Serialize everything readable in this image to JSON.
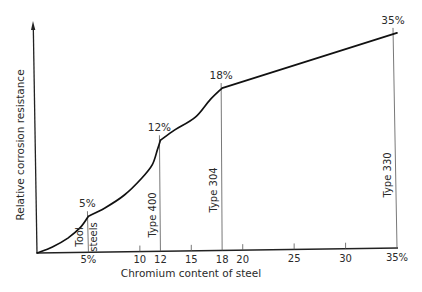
{
  "chart_data": {
    "type": "line",
    "title": "",
    "xlabel": "Chromium content of steel",
    "ylabel": "Relative corrosion resistance",
    "xlim": [
      0,
      35
    ],
    "ylim": [
      0,
      100
    ],
    "y_units": "relative (no numeric scale shown)",
    "grid": false,
    "legend": "none",
    "x_ticks": [
      5,
      10,
      12,
      15,
      18,
      20,
      25,
      30,
      35
    ],
    "x_tick_labels": [
      "5%",
      "10",
      "12",
      "15",
      "18",
      "20",
      "25",
      "30",
      "35%"
    ],
    "minor_tick_marks": [
      10,
      15,
      20,
      25,
      30
    ],
    "series": [
      {
        "name": "Relative corrosion resistance",
        "segments": [
          [
            [
              0,
              0
            ],
            [
              1.5,
              2.6
            ],
            [
              3,
              6.5
            ],
            [
              4.2,
              11
            ],
            [
              5,
              16
            ]
          ],
          [
            [
              5,
              16
            ],
            [
              6.6,
              19.6
            ],
            [
              8.5,
              25.2
            ],
            [
              10.2,
              32.6
            ],
            [
              11.2,
              38.3
            ],
            [
              11.7,
              44.8
            ],
            [
              12,
              49
            ]
          ],
          [
            [
              12,
              49
            ],
            [
              13.4,
              53.5
            ],
            [
              15.4,
              59.1
            ],
            [
              16.8,
              66.5
            ],
            [
              18,
              71.7
            ]
          ],
          [
            [
              18,
              71.7
            ],
            [
              35,
              95.7
            ]
          ]
        ]
      }
    ],
    "annotations": [
      {
        "x": 5,
        "y": 16,
        "value_label": "5%",
        "grade_labels": [
          "Tool",
          "steels"
        ]
      },
      {
        "x": 12,
        "y": 49,
        "value_label": "12%",
        "grade_labels": [
          "Type 400"
        ]
      },
      {
        "x": 18,
        "y": 71.7,
        "value_label": "18%",
        "grade_labels": [
          "Type 304"
        ]
      },
      {
        "x": 35,
        "y": 95.7,
        "value_label": "35%",
        "grade_labels": [
          "Type 330"
        ]
      }
    ]
  }
}
